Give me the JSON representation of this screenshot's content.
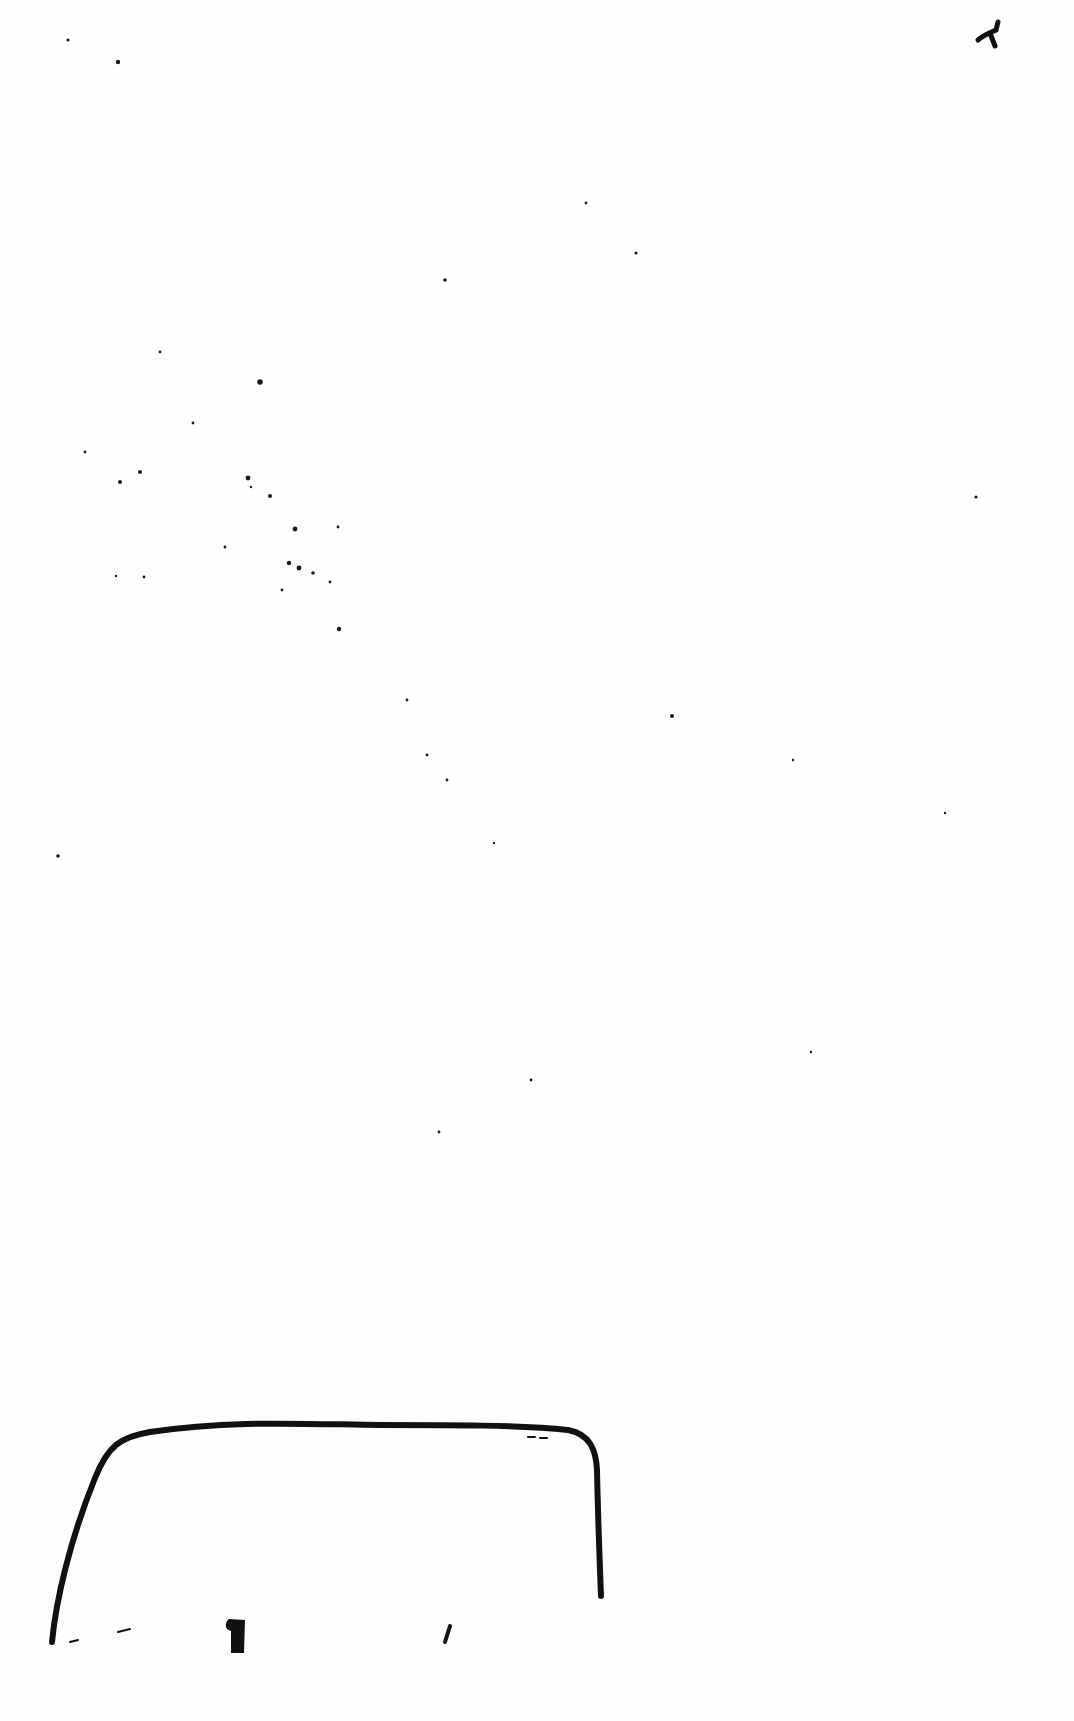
{
  "page": {
    "type": "scanned-blank-page",
    "background": "#fefefe",
    "ink_color": "#111111",
    "width": 1074,
    "height": 1721
  },
  "marks": {
    "corner_tick": {
      "description": "small handwritten tick mark, top-right",
      "path": "M978,40 C985,34 992,32 996,30 M996,30 L998,22 M990,33 L995,46"
    },
    "outline_box": {
      "description": "hand-drawn rounded rectangle outline, bottom-left",
      "path": "M52,1642 C56,1600 70,1540 95,1478 C108,1446 120,1437 150,1432 C230,1420 300,1424 380,1425 C450,1425 520,1425 568,1430 C590,1434 596,1450 597,1470 C598,1520 600,1570 601,1596",
      "inner_strokes": [
        "M70,1642 L78,1640",
        "M118,1632 L130,1629",
        "M450,1626 L445,1642"
      ],
      "inner_blob": {
        "x": 225,
        "y": 1619,
        "w": 20,
        "h": 34
      },
      "top_dashes": "M528,1437 L535,1437 M540,1438 L547,1438"
    }
  },
  "specks": [
    [
      68,
      40,
      1.6
    ],
    [
      118,
      62,
      2.2
    ],
    [
      586,
      203,
      1.4
    ],
    [
      636,
      253,
      1.6
    ],
    [
      445,
      280,
      1.8
    ],
    [
      160,
      352,
      1.4
    ],
    [
      260,
      382,
      2.8
    ],
    [
      193,
      423,
      1.4
    ],
    [
      85,
      452,
      1.4
    ],
    [
      140,
      472,
      2.0
    ],
    [
      120,
      482,
      2.0
    ],
    [
      248,
      478,
      2.4
    ],
    [
      251,
      487,
      1.2
    ],
    [
      270,
      496,
      2.0
    ],
    [
      976,
      497,
      1.6
    ],
    [
      338,
      527,
      1.4
    ],
    [
      295,
      529,
      2.4
    ],
    [
      289,
      563,
      2.2
    ],
    [
      299,
      568,
      2.4
    ],
    [
      313,
      573,
      1.8
    ],
    [
      330,
      582,
      1.4
    ],
    [
      282,
      590,
      1.4
    ],
    [
      144,
      577,
      1.4
    ],
    [
      116,
      576,
      1.2
    ],
    [
      225,
      547,
      1.4
    ],
    [
      339,
      629,
      2.2
    ],
    [
      407,
      700,
      1.4
    ],
    [
      672,
      716,
      2.0
    ],
    [
      427,
      755,
      1.4
    ],
    [
      447,
      780,
      1.4
    ],
    [
      793,
      760,
      1.2
    ],
    [
      58,
      856,
      1.8
    ],
    [
      494,
      843,
      1.2
    ],
    [
      531,
      1080,
      1.4
    ],
    [
      439,
      1132,
      1.4
    ],
    [
      945,
      813,
      1.2
    ],
    [
      811,
      1052,
      1.2
    ]
  ]
}
